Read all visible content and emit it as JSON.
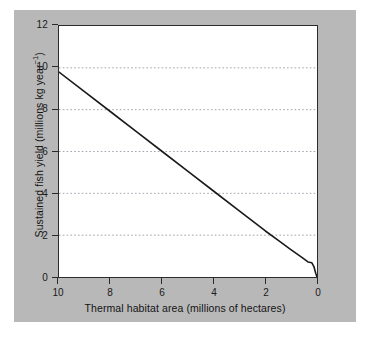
{
  "figure": {
    "background_color": "#b8b8b8",
    "plot_background_color": "#ffffff",
    "frame_color": "#2b2b2b",
    "gridline_color": "#8d8d9c",
    "line_color": "#1a1a1a"
  },
  "axes": {
    "x_title": "Thermal habitat area (millions of hectares)",
    "y_title_main": "Sustained fish yield (millions kg year",
    "y_title_exponent": "−1",
    "y_title_close": ")",
    "x_ticks": [
      "10",
      "8",
      "6",
      "4",
      "2",
      "0"
    ],
    "y_ticks": [
      "0",
      "2",
      "4",
      "6",
      "8",
      "10",
      "12"
    ]
  },
  "chart_data": {
    "type": "line",
    "title": "",
    "xlabel": "Thermal habitat area (millions of hectares)",
    "ylabel": "Sustained fish yield (millions kg year−1)",
    "xlim": [
      10,
      0
    ],
    "ylim": [
      0,
      12
    ],
    "x_reversed": true,
    "grid": "horizontal-dotted",
    "legend": "none",
    "x_tick_values": [
      10,
      8,
      6,
      4,
      2,
      0
    ],
    "y_tick_values": [
      0,
      2,
      4,
      6,
      8,
      10,
      12
    ],
    "gridline_values": [
      2,
      4,
      6,
      8,
      10
    ],
    "series": [
      {
        "name": "Sustained fish yield",
        "x": [
          10.0,
          9.0,
          8.0,
          7.0,
          6.0,
          5.0,
          4.0,
          3.0,
          2.0,
          1.5,
          1.0,
          0.6,
          0.35,
          0.2,
          0.12,
          0.05,
          0.0
        ],
        "values": [
          9.8,
          8.85,
          7.9,
          6.95,
          6.0,
          5.05,
          4.1,
          3.15,
          2.2,
          1.75,
          1.3,
          0.95,
          0.72,
          0.68,
          0.5,
          0.18,
          0.0
        ]
      }
    ]
  }
}
